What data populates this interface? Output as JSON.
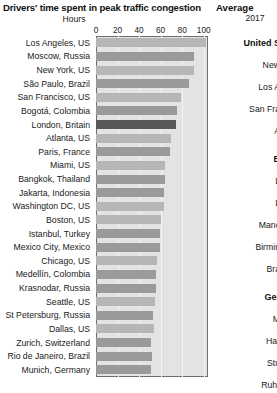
{
  "left": {
    "title": "Drivers' time spent in peak traffic congestion",
    "axis_unit": "Hours"
  },
  "right": {
    "title": "Average",
    "subtitle": "2017",
    "entries": [
      {
        "text": "United S",
        "type": "group"
      },
      {
        "text": "New",
        "type": "city"
      },
      {
        "text": "Los A",
        "type": "city"
      },
      {
        "text": "San Fra",
        "type": "city"
      },
      {
        "text": "A",
        "type": "city"
      },
      {
        "text": "B",
        "type": "group"
      },
      {
        "text": "L",
        "type": "city"
      },
      {
        "text": "L",
        "type": "city"
      },
      {
        "text": "Manc",
        "type": "city"
      },
      {
        "text": "Birmin",
        "type": "city"
      },
      {
        "text": "Bra",
        "type": "city"
      },
      {
        "text": "Ger",
        "type": "group"
      },
      {
        "text": "M",
        "type": "city"
      },
      {
        "text": "Har",
        "type": "city"
      },
      {
        "text": "Stu",
        "type": "city"
      },
      {
        "text": "Ruhr",
        "type": "city"
      }
    ]
  },
  "chart_data": {
    "type": "bar",
    "orientation": "horizontal",
    "title": "Drivers' time spent in peak traffic congestion",
    "xlabel": "Hours",
    "ylabel": "",
    "xlim": [
      0,
      104
    ],
    "ticks": [
      0,
      20,
      40,
      60,
      80,
      100
    ],
    "grid": true,
    "legend": null,
    "categories": [
      "Los Angeles, US",
      "Moscow, Russia",
      "New York, US",
      "São Paulo, Brazil",
      "San Francisco, US",
      "Bogotá, Colombia",
      "London, Britain",
      "Atlanta, US",
      "Paris, France",
      "Miami, US",
      "Bangkok, Thailand",
      "Jakarta, Indonesia",
      "Washington DC, US",
      "Boston, US",
      "Istanbul, Turkey",
      "Mexico City, Mexico",
      "Chicago, US",
      "Medellín, Colombia",
      "Krasnodar, Russia",
      "Seattle, US",
      "St Petersburg, Russia",
      "Dallas, US",
      "Zurich, Switzerland",
      "Rio de Janeiro, Brazil",
      "Munich, Germany"
    ],
    "values": [
      102,
      91,
      91,
      86,
      79,
      75,
      74,
      70,
      69,
      64,
      64,
      63,
      63,
      60,
      59,
      59,
      57,
      56,
      56,
      55,
      53,
      54,
      51,
      52,
      51
    ],
    "shades": [
      "us",
      "other",
      "us",
      "other",
      "us",
      "other",
      "hl",
      "us",
      "other",
      "us",
      "other",
      "other",
      "us",
      "us",
      "other",
      "other",
      "us",
      "other",
      "other",
      "us",
      "other",
      "us",
      "other",
      "other",
      "other"
    ],
    "colors": {
      "us_city": "#b6b6b6",
      "other_city": "#9a9a9a",
      "highlight_london": "#595959",
      "plot_background": "#e3e3e3",
      "plot_border": "#6e6e6e"
    }
  }
}
